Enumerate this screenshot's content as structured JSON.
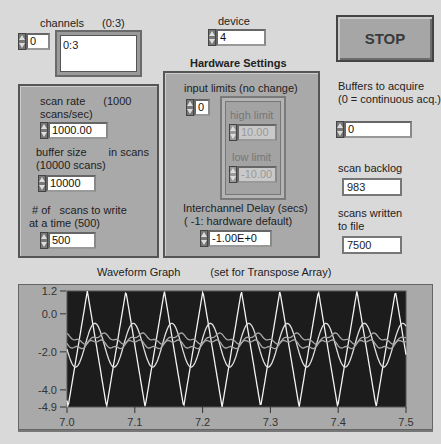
{
  "channels": {
    "label": "channels",
    "hint": "(0:3)",
    "index_value": "0",
    "value": "0:3"
  },
  "device": {
    "label": "device",
    "value": "4"
  },
  "stop_button": {
    "label": "STOP"
  },
  "acquisition_panel": {
    "scan_rate": {
      "label_1": "scan rate",
      "label_2": "(1000",
      "label_3": "scans/sec)",
      "value": "1000.00"
    },
    "buffer_size": {
      "label_1": "buffer size",
      "label_2": "in scans",
      "label_3": "(10000 scans)",
      "value": "10000"
    },
    "scans_to_write": {
      "label_1": "# of   scans to write",
      "label_2": "at a time (500)",
      "value": "500"
    }
  },
  "hardware_settings": {
    "title": "Hardware Settings",
    "input_limits": {
      "label": "input limits (no change)",
      "index_value": "0",
      "high_limit": {
        "label": "high limit",
        "value": "10.00"
      },
      "low_limit": {
        "label": "low limit",
        "value": "-10.00"
      }
    },
    "interchannel_delay": {
      "label_1": "Interchannel Delay (secs)",
      "label_2": "( -1: hardware default)",
      "value": "-1.00E+0"
    }
  },
  "buffers_to_acquire": {
    "label_1": "Buffers to acquire",
    "label_2": "(0 = continuous acq.)",
    "value": "0"
  },
  "scan_backlog": {
    "label": "scan backlog",
    "value": "983"
  },
  "scans_written": {
    "label_1": "scans written",
    "label_2": "to file",
    "value": "7500"
  },
  "graph": {
    "title": "Waveform Graph",
    "subtitle": "(set for Transpose Array)"
  },
  "chart_data": {
    "type": "line",
    "title": "Waveform Graph",
    "subtitle": "(set for Transpose Array)",
    "xlabel": "",
    "ylabel": "",
    "xlim": [
      7.0,
      7.5
    ],
    "ylim": [
      -4.9,
      1.2
    ],
    "x_ticks": [
      "7.0",
      "7.1",
      "7.2",
      "7.3",
      "7.4",
      "7.5"
    ],
    "y_ticks": [
      "1.2",
      "0.0",
      "-2.0",
      "-4.0",
      "-4.9"
    ],
    "grid": false,
    "background": "#1a1a1a",
    "line_color": "#f2f2f2",
    "series": [
      {
        "name": "ch0",
        "shape": "triangle",
        "min": -4.9,
        "max": 1.2,
        "period": 0.0568,
        "first_peak_x": 7.03
      },
      {
        "name": "ch1",
        "shape": "smoothed triangle",
        "min": -2.8,
        "max": -0.5,
        "period": 0.0568,
        "first_peak_x": 7.035
      },
      {
        "name": "ch2",
        "shape": "ripple",
        "min": -1.6,
        "max": -1.0,
        "period": 0.0568
      },
      {
        "name": "ch3",
        "shape": "ripple",
        "min": -1.9,
        "max": -1.3,
        "period": 0.0568
      }
    ]
  }
}
